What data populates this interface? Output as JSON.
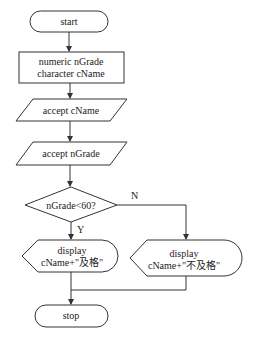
{
  "flowchart": {
    "start": {
      "label": "start"
    },
    "declare": {
      "line1": "numeric nGrade",
      "line2": "character cName"
    },
    "input_name": {
      "label": "accept cName"
    },
    "input_grade": {
      "label": "accept nGrade"
    },
    "decision": {
      "label": "nGrade<60?",
      "yes_label": "Y",
      "no_label": "N"
    },
    "display_pass": {
      "line1": "display",
      "line2": "cName+\"及格\""
    },
    "display_fail": {
      "line1": "display",
      "line2": "cName+\"不及格\""
    },
    "stop": {
      "label": "stop"
    }
  }
}
